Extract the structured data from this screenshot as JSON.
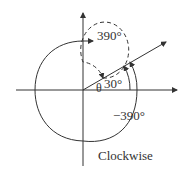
{
  "diagram": {
    "labels": {
      "positive_angle": "390°",
      "negative_angle": "−390°",
      "small_angle": "30°",
      "theta": "θ",
      "direction": "Clockwise"
    },
    "colors": {
      "stroke": "#333333",
      "background": "#ffffff"
    }
  }
}
